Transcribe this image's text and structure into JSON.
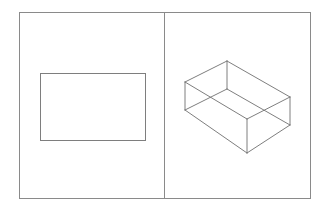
{
  "document": {
    "title": "Two-panel geometry figure",
    "background_color": "#ffffff",
    "width": 328,
    "height": 212
  },
  "frame": {
    "name": "outer-frame",
    "x": 19,
    "y": 12,
    "width": 292,
    "height": 187,
    "stroke_color": "#8a8a8a",
    "stroke_width": 1,
    "fill": "none"
  },
  "divider": {
    "name": "vertical-divider",
    "x": 164.5,
    "y1": 12,
    "y2": 199,
    "stroke_color": "#8a8a8a",
    "stroke_width": 1
  },
  "panels": [
    {
      "id": "left-panel",
      "label": "2D rectangle panel",
      "x": 19,
      "y": 12,
      "width": 145.5,
      "height": 187
    },
    {
      "id": "right-panel",
      "label": "3D wireframe box panel",
      "x": 164.5,
      "y": 12,
      "width": 146.5,
      "height": 187
    }
  ],
  "left_shape": {
    "name": "flat-rectangle",
    "type": "rectangle",
    "x": 40,
    "y": 73,
    "width": 106,
    "height": 68,
    "stroke_color": "#7e7e7e",
    "stroke_width": 1,
    "fill": "none"
  },
  "right_shape": {
    "name": "isometric-box",
    "type": "wireframe-rectangular-prism",
    "projection": "oblique-isometric",
    "stroke_color": "#6f6f6f",
    "hidden_stroke_color": "#9a9a9a",
    "stroke_width": 0.9,
    "vertices": {
      "top_left": [
        185,
        82
      ],
      "top_back": [
        227,
        61
      ],
      "top_right": [
        290,
        97
      ],
      "top_front": [
        247,
        119
      ],
      "bottom_left": [
        185,
        110
      ],
      "bottom_back": [
        227,
        89
      ],
      "bottom_right": [
        290,
        125
      ],
      "bottom_front": [
        247,
        153
      ]
    },
    "edges": [
      {
        "name": "top-left-to-top-back",
        "from": "top_left",
        "to": "top_back",
        "visible": true
      },
      {
        "name": "top-back-to-top-right",
        "from": "top_back",
        "to": "top_right",
        "visible": true
      },
      {
        "name": "top-right-to-top-front",
        "from": "top_right",
        "to": "top_front",
        "visible": true
      },
      {
        "name": "top-front-to-top-left",
        "from": "top_front",
        "to": "top_left",
        "visible": true
      },
      {
        "name": "bottom-left-to-bottom-back",
        "from": "bottom_left",
        "to": "bottom_back",
        "visible": true
      },
      {
        "name": "bottom-back-to-bottom-right",
        "from": "bottom_back",
        "to": "bottom_right",
        "visible": true
      },
      {
        "name": "bottom-right-to-bottom-front",
        "from": "bottom_right",
        "to": "bottom_front",
        "visible": true
      },
      {
        "name": "bottom-front-to-bottom-left",
        "from": "bottom_front",
        "to": "bottom_left",
        "visible": true
      },
      {
        "name": "vertical-left",
        "from": "top_left",
        "to": "bottom_left",
        "visible": true
      },
      {
        "name": "vertical-back",
        "from": "top_back",
        "to": "bottom_back",
        "visible": true
      },
      {
        "name": "vertical-right",
        "from": "top_right",
        "to": "bottom_right",
        "visible": true
      },
      {
        "name": "vertical-front",
        "from": "top_front",
        "to": "bottom_front",
        "visible": true
      }
    ]
  }
}
